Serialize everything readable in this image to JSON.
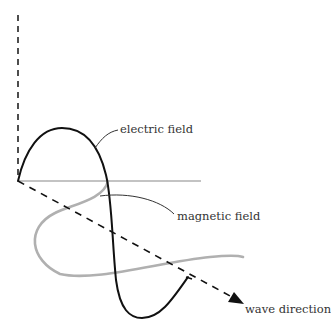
{
  "diagram": {
    "labels": {
      "electric": "electric field",
      "magnetic": "magnetic field",
      "direction": "wave direction"
    },
    "colors": {
      "electric": "#111111",
      "magnetic": "#b0b0b0",
      "axis": "#222222",
      "baseline": "#888888"
    }
  }
}
